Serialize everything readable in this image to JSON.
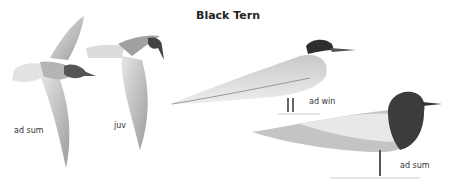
{
  "title": "Black Tern",
  "labels": {
    "flight_adult_summer": "ad sum",
    "flight_juvenile": "juv",
    "standing_adult_winter": "ad win",
    "standing_adult_summer": "ad sum"
  },
  "colors": {
    "background": "#ffffff",
    "plumage_light": "#d4d4d4",
    "plumage_mid": "#a8a8a8",
    "plumage_dark": "#3a3a3a",
    "text": "#333333"
  }
}
